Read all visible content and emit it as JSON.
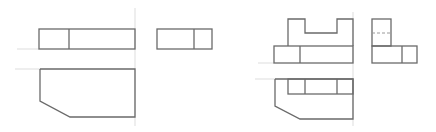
{
  "diagram": {
    "type": "orthographic-projection",
    "colors": {
      "object_line": "#6a6a6a",
      "reference_line": "#d4d4d4",
      "hidden_line": "#9a9a9a",
      "background": "#ffffff"
    },
    "figures": [
      {
        "id": "left",
        "views": [
          "front",
          "side",
          "top"
        ],
        "description": "Rectangular block with chamfered corner in top view"
      },
      {
        "id": "right",
        "views": [
          "front",
          "side",
          "top"
        ],
        "description": "Block with U-shaped slot and chamfered corner in top view, hidden line in side view"
      }
    ]
  }
}
